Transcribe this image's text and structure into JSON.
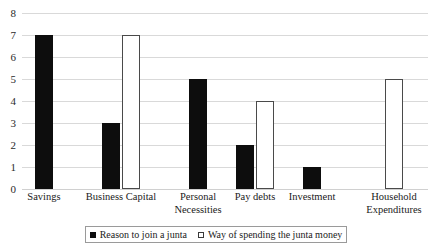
{
  "chart_data": {
    "type": "bar",
    "title": "",
    "subtitle": "",
    "xlabel": "",
    "ylabel": "",
    "ylim": [
      0,
      8
    ],
    "ytick_labels": [
      "8",
      "7",
      "6",
      "5",
      "4",
      "3",
      "2",
      "1",
      "0"
    ],
    "ytick_values": [
      8,
      7,
      6,
      5,
      4,
      3,
      2,
      1,
      0
    ],
    "grid": true,
    "grid_axis": "y",
    "legend_position": "bottom",
    "categories": [
      "Savings",
      "Business Capital",
      "Personal Necessities",
      "Pay debts",
      "Investment",
      "Household Expenditures"
    ],
    "category_lines": [
      [
        "Savings"
      ],
      [
        "Business Capital"
      ],
      [
        "Personal",
        "Necessities"
      ],
      [
        "Pay debts"
      ],
      [
        "Investment"
      ],
      [
        "Household",
        "Expenditures"
      ]
    ],
    "series": [
      {
        "name": "Reason to join a junta",
        "style": "filled",
        "color": "#0d0d0d",
        "values": [
          7,
          3,
          5,
          2,
          1,
          0
        ]
      },
      {
        "name": "Way of spending the junta money",
        "style": "hollow",
        "color": "#ffffff",
        "edge_color": "#4a4a4a",
        "values": [
          0,
          7,
          0,
          4,
          0,
          5
        ]
      }
    ]
  },
  "legend": {
    "entries": [
      {
        "label": "Reason to join a junta",
        "swatch": "filled-square-icon"
      },
      {
        "label": "Way of spending the junta money",
        "swatch": "hollow-square-icon"
      }
    ]
  },
  "colors": {
    "filled_series": "#0d0d0d",
    "hollow_series_edge": "#4a4a4a",
    "gridline": "#d9d9d9",
    "legend_border": "#9a9a9a",
    "text": "#1a1a1a",
    "background": "#ffffff"
  }
}
